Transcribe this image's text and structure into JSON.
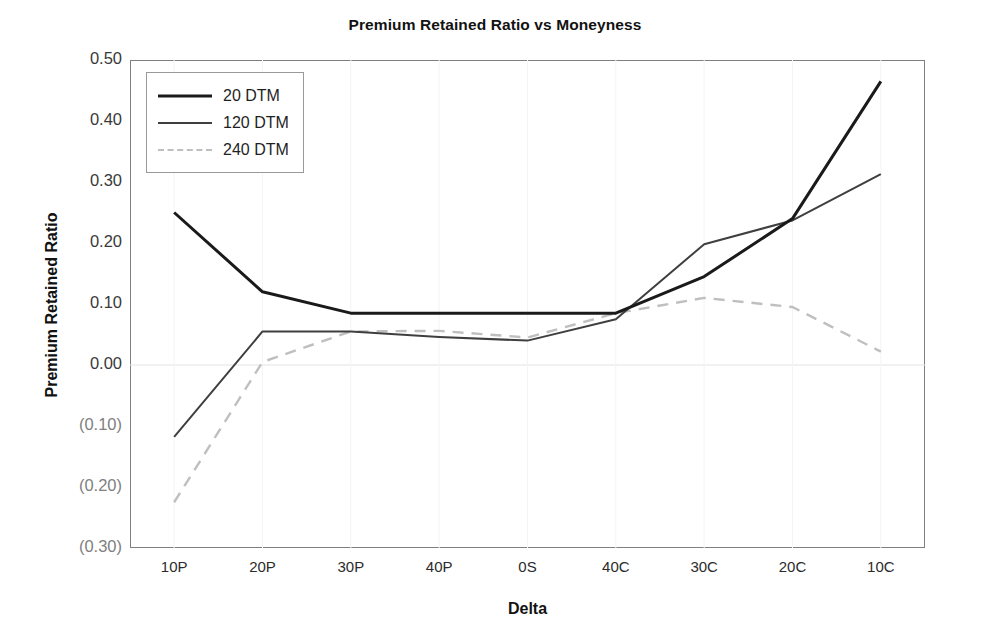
{
  "chart_data": {
    "type": "line",
    "title": "Premium Retained Ratio vs Moneyness",
    "xlabel": "Delta",
    "ylabel": "Premium Retained Ratio",
    "categories": [
      "10P",
      "20P",
      "30P",
      "40P",
      "0S",
      "40C",
      "30C",
      "20C",
      "10C"
    ],
    "ylim": [
      -0.3,
      0.5
    ],
    "yticks": [
      0.5,
      0.4,
      0.3,
      0.2,
      0.1,
      0.0,
      -0.1,
      -0.2,
      -0.3
    ],
    "ytick_labels": [
      "0.50",
      "0.40",
      "0.30",
      "0.20",
      "0.10",
      "0.00",
      "(0.10)",
      "(0.20)",
      "(0.30)"
    ],
    "grid": "zero-line-only",
    "legend_position": "top-left-inside",
    "series": [
      {
        "name": "20 DTM",
        "color": "#1a1a1a",
        "width": 3.0,
        "dash": "solid",
        "values": [
          0.25,
          0.12,
          0.085,
          0.085,
          0.085,
          0.085,
          0.145,
          0.24,
          0.465
        ]
      },
      {
        "name": "120 DTM",
        "color": "#3f3f3f",
        "width": 2.0,
        "dash": "solid",
        "values": [
          -0.118,
          0.055,
          0.055,
          0.046,
          0.04,
          0.075,
          0.198,
          0.237,
          0.313
        ]
      },
      {
        "name": "240 DTM",
        "color": "#bfbfbf",
        "width": 2.4,
        "dash": "dashed",
        "values": [
          -0.225,
          0.005,
          0.055,
          0.056,
          0.045,
          0.085,
          0.11,
          0.095,
          0.022
        ]
      }
    ]
  },
  "legend": {
    "items": [
      {
        "label": "20 DTM"
      },
      {
        "label": "120 DTM"
      },
      {
        "label": "240 DTM"
      }
    ]
  }
}
